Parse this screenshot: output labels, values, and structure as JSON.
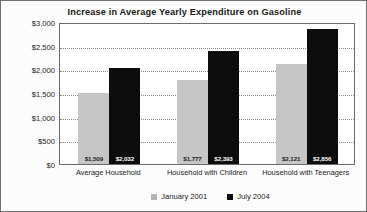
{
  "chart_data": {
    "type": "bar",
    "title": "Increase in Average Yearly Expenditure on Gasoline",
    "xlabel": "",
    "ylabel": "",
    "ylim": [
      0,
      3000
    ],
    "ytick_labels": [
      "$3,000",
      "$2,500",
      "$2,000",
      "$1,500",
      "$1,000",
      "$500",
      "$0"
    ],
    "ytick_values": [
      3000,
      2500,
      2000,
      1500,
      1000,
      500,
      0
    ],
    "grid": true,
    "legend_position": "bottom",
    "categories": [
      "Average Household",
      "Household with Children",
      "Household with Teenagers"
    ],
    "series": [
      {
        "name": "January 2001",
        "color": "#c6c6c6",
        "values": [
          1509,
          1777,
          2121
        ],
        "labels": [
          "$1,509",
          "$1,777",
          "$2,121"
        ]
      },
      {
        "name": "July 2004",
        "color": "#0d0d0d",
        "values": [
          2032,
          2393,
          2856
        ],
        "labels": [
          "$2,032",
          "$2,393",
          "$2,856"
        ]
      }
    ]
  }
}
